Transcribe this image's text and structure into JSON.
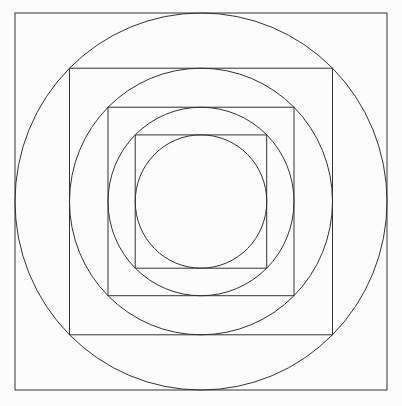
{
  "canvas": {
    "width": 402,
    "height": 406,
    "background": "#fcfcfc"
  },
  "style": {
    "stroke_color": "#333333",
    "stroke_width": 1,
    "fill": "none"
  },
  "figure": {
    "center": {
      "cx": 201,
      "cy": 201.5
    },
    "shapes": [
      {
        "type": "rect",
        "name": "outer-square",
        "x": 15,
        "y": 13,
        "width": 372,
        "height": 377
      },
      {
        "type": "ellipse",
        "name": "outer-circle",
        "cx": 201,
        "cy": 201.5,
        "rx": 186,
        "ry": 188.5
      },
      {
        "type": "rect",
        "name": "second-square",
        "x": 69.5,
        "y": 68.2,
        "width": 263,
        "height": 266.6
      },
      {
        "type": "ellipse",
        "name": "second-circle",
        "cx": 201,
        "cy": 201.5,
        "rx": 131.5,
        "ry": 133.3
      },
      {
        "type": "rect",
        "name": "third-square",
        "x": 108,
        "y": 107.2,
        "width": 186,
        "height": 188.5
      },
      {
        "type": "ellipse",
        "name": "third-circle",
        "cx": 201,
        "cy": 201.5,
        "rx": 93,
        "ry": 94.25
      },
      {
        "type": "rect",
        "name": "inner-square",
        "x": 135.2,
        "y": 134.9,
        "width": 131.5,
        "height": 133.3
      },
      {
        "type": "ellipse",
        "name": "inner-circle",
        "cx": 201,
        "cy": 201.5,
        "rx": 65.75,
        "ry": 66.65
      }
    ]
  }
}
